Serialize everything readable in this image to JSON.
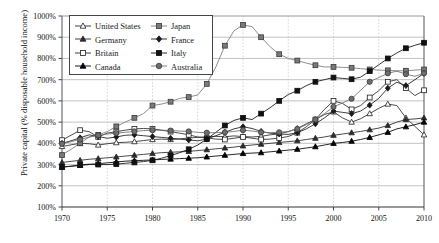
{
  "chart_data": {
    "type": "line",
    "title": "",
    "xlabel": "",
    "ylabel": "Private capital (% disposable household income)",
    "xlim": [
      1970,
      2010
    ],
    "ylim": [
      100,
      1000
    ],
    "yticks": [
      "100%",
      "200%",
      "300%",
      "400%",
      "500%",
      "600%",
      "700%",
      "800%",
      "900%",
      "1000%"
    ],
    "ytick_values": [
      100,
      200,
      300,
      400,
      500,
      600,
      700,
      800,
      900,
      1000
    ],
    "xticks": [
      "1970",
      "1975",
      "1980",
      "1985",
      "1990",
      "1995",
      "2000",
      "2005",
      "2010"
    ],
    "xtick_values": [
      1970,
      1975,
      1980,
      1985,
      1990,
      1995,
      2000,
      2005,
      2010
    ],
    "grid": true,
    "legend_position": "upper-left-inside",
    "x": [
      1970,
      1971,
      1972,
      1973,
      1974,
      1975,
      1976,
      1977,
      1978,
      1979,
      1980,
      1981,
      1982,
      1983,
      1984,
      1985,
      1986,
      1987,
      1988,
      1989,
      1990,
      1991,
      1992,
      1993,
      1994,
      1995,
      1996,
      1997,
      1998,
      1999,
      2000,
      2001,
      2002,
      2003,
      2004,
      2005,
      2006,
      2007,
      2008,
      2009,
      2010
    ],
    "series": [
      {
        "name": "United States",
        "marker": "open-triangle",
        "color": "#2b2b2b",
        "values": [
          385,
          393,
          400,
          398,
          392,
          398,
          403,
          405,
          408,
          413,
          418,
          420,
          418,
          421,
          425,
          428,
          431,
          433,
          431,
          435,
          432,
          430,
          433,
          440,
          445,
          455,
          470,
          492,
          512,
          536,
          548,
          520,
          500,
          516,
          540,
          565,
          585,
          578,
          520,
          480,
          440
        ]
      },
      {
        "name": "Germany",
        "marker": "filled-triangle",
        "color": "#2b2b2b",
        "values": [
          310,
          315,
          320,
          325,
          328,
          332,
          336,
          340,
          344,
          348,
          352,
          356,
          358,
          360,
          362,
          366,
          370,
          374,
          378,
          382,
          388,
          392,
          396,
          400,
          404,
          408,
          412,
          418,
          424,
          430,
          438,
          444,
          450,
          456,
          464,
          472,
          484,
          500,
          512,
          515,
          520
        ]
      },
      {
        "name": "Britain",
        "marker": "open-square",
        "color": "#2b2b2b",
        "values": [
          415,
          438,
          462,
          455,
          430,
          448,
          455,
          462,
          468,
          470,
          468,
          462,
          455,
          448,
          440,
          430,
          425,
          420,
          418,
          424,
          430,
          424,
          418,
          420,
          425,
          432,
          450,
          478,
          512,
          560,
          600,
          588,
          560,
          578,
          616,
          648,
          690,
          700,
          660,
          625,
          650
        ]
      },
      {
        "name": "Canada",
        "marker": "filled-triangle-dark",
        "color": "#000000",
        "values": [
          288,
          292,
          296,
          300,
          304,
          308,
          312,
          316,
          318,
          320,
          322,
          324,
          326,
          328,
          330,
          332,
          336,
          340,
          344,
          348,
          352,
          354,
          356,
          360,
          364,
          368,
          372,
          378,
          384,
          392,
          400,
          404,
          410,
          418,
          428,
          440,
          452,
          468,
          478,
          488,
          500
        ]
      },
      {
        "name": "Japan",
        "marker": "gray-square",
        "color": "#7a7a7a",
        "values": [
          345,
          372,
          400,
          430,
          440,
          455,
          480,
          500,
          520,
          540,
          578,
          585,
          596,
          612,
          618,
          628,
          680,
          760,
          860,
          930,
          958,
          950,
          900,
          855,
          820,
          800,
          790,
          778,
          768,
          760,
          760,
          758,
          756,
          752,
          748,
          745,
          744,
          742,
          742,
          745,
          748
        ]
      },
      {
        "name": "France",
        "marker": "filled-diamond",
        "color": "#1a1a1a",
        "values": [
          400,
          412,
          426,
          440,
          432,
          424,
          430,
          438,
          440,
          436,
          432,
          428,
          424,
          420,
          416,
          412,
          420,
          436,
          452,
          468,
          478,
          470,
          456,
          448,
          444,
          442,
          450,
          468,
          492,
          520,
          552,
          546,
          540,
          552,
          580,
          612,
          660,
          688,
          672,
          700,
          730
        ]
      },
      {
        "name": "Italy",
        "marker": "filled-square",
        "color": "#111111",
        "values": [
          288,
          292,
          298,
          302,
          300,
          300,
          302,
          306,
          310,
          314,
          320,
          330,
          342,
          356,
          372,
          392,
          420,
          452,
          484,
          508,
          520,
          512,
          540,
          568,
          600,
          630,
          648,
          672,
          690,
          700,
          710,
          706,
          702,
          712,
          740,
          770,
          800,
          826,
          848,
          862,
          874
        ]
      },
      {
        "name": "Australia",
        "marker": "gray-circle",
        "color": "#6e6e6e",
        "values": [
          398,
          408,
          418,
          430,
          438,
          444,
          448,
          452,
          456,
          460,
          462,
          462,
          460,
          458,
          456,
          452,
          450,
          450,
          452,
          456,
          462,
          458,
          452,
          450,
          452,
          456,
          468,
          488,
          512,
          540,
          572,
          590,
          610,
          650,
          690,
          710,
          730,
          740,
          726,
          716,
          730
        ]
      }
    ]
  }
}
